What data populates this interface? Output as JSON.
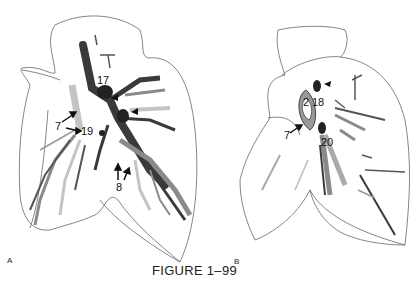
{
  "figure": {
    "caption": "FIGURE 1–99",
    "panels": [
      {
        "id": "A",
        "label": "A",
        "structure_labels": [
          "17",
          "3",
          "4",
          "7",
          "19",
          "8"
        ]
      },
      {
        "id": "B",
        "label": "B",
        "structure_labels": [
          "2",
          "18",
          "7",
          "20"
        ]
      }
    ]
  },
  "colors": {
    "outline": "#555555",
    "dark_vessel": "#3a3a3a",
    "mid_vessel": "#8a8a8a",
    "light_vessel": "#c4c4c4",
    "background": "#ffffff"
  }
}
